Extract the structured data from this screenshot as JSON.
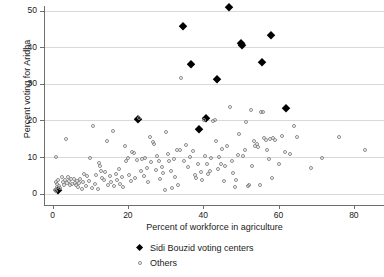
{
  "chart_data": {
    "type": "scatter",
    "title": "",
    "xlabel": "Percent of workforce in agriculture",
    "ylabel": "Percent voting for Aridha",
    "xlim": [
      -2,
      88
    ],
    "ylim": [
      -1.5,
      53
    ],
    "xticks": [
      0,
      20,
      40,
      60,
      80
    ],
    "yticks": [
      0,
      10,
      20,
      30,
      40,
      50
    ],
    "grid": "horizontal",
    "legend_position": "bottom-center",
    "series": [
      {
        "name": "Sidi Bouzid voting centers",
        "marker": "filled-diamond",
        "color": "#000000",
        "points": [
          [
            46.8,
            51.2
          ],
          [
            34.6,
            46.0
          ],
          [
            57.9,
            43.3
          ],
          [
            50.0,
            41.3
          ],
          [
            50.3,
            40.8
          ],
          [
            55.6,
            36.1
          ],
          [
            36.8,
            35.6
          ],
          [
            43.6,
            31.3
          ],
          [
            62.1,
            23.4
          ],
          [
            40.7,
            20.8
          ],
          [
            22.6,
            20.4
          ],
          [
            38.9,
            17.8
          ],
          [
            1.4,
            1.0
          ]
        ]
      },
      {
        "name": "Others",
        "marker": "open-circle",
        "color": "#8a8a8a",
        "points": [
          [
            1.0,
            10.0
          ],
          [
            3.6,
            14.9
          ],
          [
            0.8,
            3.2
          ],
          [
            1.2,
            2.6
          ],
          [
            1.5,
            3.6
          ],
          [
            1.8,
            2.0
          ],
          [
            2.1,
            1.4
          ],
          [
            0.6,
            1.1
          ],
          [
            0.9,
            0.7
          ],
          [
            1.3,
            1.9
          ],
          [
            2.4,
            4.4
          ],
          [
            2.8,
            3.1
          ],
          [
            3.1,
            2.4
          ],
          [
            3.4,
            3.7
          ],
          [
            3.8,
            2.9
          ],
          [
            4.1,
            4.6
          ],
          [
            4.4,
            3.3
          ],
          [
            4.7,
            2.2
          ],
          [
            5.0,
            3.9
          ],
          [
            5.3,
            2.7
          ],
          [
            5.6,
            4.1
          ],
          [
            5.9,
            3.0
          ],
          [
            6.2,
            2.3
          ],
          [
            6.5,
            3.5
          ],
          [
            6.8,
            1.7
          ],
          [
            7.1,
            2.8
          ],
          [
            7.4,
            4.0
          ],
          [
            7.7,
            1.2
          ],
          [
            8.0,
            3.2
          ],
          [
            8.4,
            5.4
          ],
          [
            8.8,
            2.1
          ],
          [
            9.2,
            4.8
          ],
          [
            9.6,
            3.4
          ],
          [
            10.0,
            9.7
          ],
          [
            10.4,
            1.6
          ],
          [
            10.8,
            18.5
          ],
          [
            11.2,
            2.5
          ],
          [
            11.6,
            5.1
          ],
          [
            12.0,
            1.3
          ],
          [
            12.3,
            8.4
          ],
          [
            12.6,
            7.5
          ],
          [
            12.9,
            6.2
          ],
          [
            13.2,
            4.3
          ],
          [
            13.6,
            3.6
          ],
          [
            14.0,
            5.8
          ],
          [
            14.4,
            14.5
          ],
          [
            14.8,
            2.4
          ],
          [
            15.2,
            4.7
          ],
          [
            15.6,
            3.2
          ],
          [
            16.0,
            17.1
          ],
          [
            16.4,
            2.0
          ],
          [
            16.8,
            5.3
          ],
          [
            17.2,
            3.8
          ],
          [
            17.6,
            6.8
          ],
          [
            18.0,
            2.6
          ],
          [
            18.4,
            4.4
          ],
          [
            18.8,
            1.9
          ],
          [
            19.2,
            13.1
          ],
          [
            19.6,
            8.9
          ],
          [
            20.0,
            9.6
          ],
          [
            20.4,
            5.0
          ],
          [
            20.8,
            3.5
          ],
          [
            21.2,
            11.5
          ],
          [
            21.6,
            11.1
          ],
          [
            22.0,
            4.2
          ],
          [
            22.4,
            9.1
          ],
          [
            23.0,
            20.6
          ],
          [
            23.4,
            6.2
          ],
          [
            23.8,
            9.4
          ],
          [
            24.2,
            4.9
          ],
          [
            24.6,
            9.6
          ],
          [
            25.0,
            7.1
          ],
          [
            25.4,
            3.2
          ],
          [
            25.8,
            15.4
          ],
          [
            26.2,
            8.6
          ],
          [
            26.6,
            14.0
          ],
          [
            27.0,
            13.6
          ],
          [
            27.4,
            6.5
          ],
          [
            27.8,
            10.4
          ],
          [
            28.2,
            9.0
          ],
          [
            28.6,
            4.0
          ],
          [
            29.0,
            7.3
          ],
          [
            29.4,
            5.7
          ],
          [
            29.8,
            1.0
          ],
          [
            30.2,
            16.8
          ],
          [
            30.6,
            10.8
          ],
          [
            31.0,
            8.8
          ],
          [
            31.4,
            6.1
          ],
          [
            31.8,
            1.4
          ],
          [
            32.2,
            9.4
          ],
          [
            32.6,
            4.6
          ],
          [
            33.0,
            12.0
          ],
          [
            33.4,
            2.3
          ],
          [
            33.8,
            11.8
          ],
          [
            34.2,
            31.6
          ],
          [
            34.8,
            9.0
          ],
          [
            35.4,
            13.2
          ],
          [
            36.0,
            7.4
          ],
          [
            36.6,
            10.0
          ],
          [
            37.2,
            11.6
          ],
          [
            37.8,
            5.2
          ],
          [
            38.2,
            4.2
          ],
          [
            38.6,
            8.0
          ],
          [
            39.4,
            6.0
          ],
          [
            39.8,
            3.7
          ],
          [
            40.2,
            20.1
          ],
          [
            40.6,
            10.4
          ],
          [
            41.0,
            8.2
          ],
          [
            41.4,
            5.4
          ],
          [
            41.8,
            6.1
          ],
          [
            42.2,
            9.8
          ],
          [
            42.6,
            19.9
          ],
          [
            43.0,
            20.0
          ],
          [
            43.4,
            14.5
          ],
          [
            43.8,
            6.8
          ],
          [
            44.2,
            9.9
          ],
          [
            44.6,
            8.0
          ],
          [
            45.0,
            12.3
          ],
          [
            45.4,
            3.5
          ],
          [
            45.8,
            7.6
          ],
          [
            46.2,
            13.0
          ],
          [
            47.2,
            23.6
          ],
          [
            47.6,
            9.0
          ],
          [
            48.0,
            5.5
          ],
          [
            48.4,
            1.7
          ],
          [
            48.8,
            3.7
          ],
          [
            49.2,
            10.6
          ],
          [
            49.6,
            16.4
          ],
          [
            50.6,
            10.2
          ],
          [
            51.0,
            12.0
          ],
          [
            51.4,
            19.5
          ],
          [
            51.8,
            2.1
          ],
          [
            52.2,
            2.2
          ],
          [
            52.6,
            23.0
          ],
          [
            53.0,
            7.6
          ],
          [
            53.4,
            14.4
          ],
          [
            53.8,
            13.0
          ],
          [
            54.2,
            13.6
          ],
          [
            54.6,
            12.8
          ],
          [
            55.0,
            2.2
          ],
          [
            55.4,
            22.4
          ],
          [
            55.8,
            22.2
          ],
          [
            56.2,
            15.2
          ],
          [
            56.6,
            14.7
          ],
          [
            57.0,
            11.8
          ],
          [
            57.4,
            9.5
          ],
          [
            57.8,
            14.8
          ],
          [
            58.2,
            4.3
          ],
          [
            58.6,
            15.2
          ],
          [
            59.0,
            14.7
          ],
          [
            60.2,
            8.0
          ],
          [
            61.0,
            15.7
          ],
          [
            61.6,
            11.3
          ],
          [
            63.0,
            10.7
          ],
          [
            64.2,
            18.6
          ],
          [
            65.0,
            15.4
          ],
          [
            68.6,
            6.9
          ],
          [
            71.6,
            9.8
          ],
          [
            76.0,
            15.5
          ],
          [
            83.0,
            12.0
          ]
        ]
      }
    ]
  },
  "legend": {
    "items": [
      {
        "label": "Sidi Bouzid voting centers",
        "marker": "filled-diamond"
      },
      {
        "label": "Others",
        "marker": "open-circle"
      }
    ]
  }
}
